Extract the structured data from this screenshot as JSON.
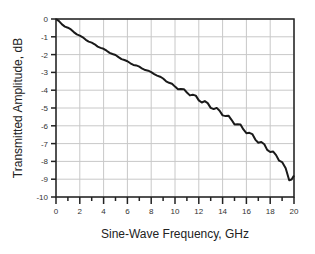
{
  "chart_data": {
    "type": "line",
    "title": "",
    "xlabel": "Sine-Wave Frequency, GHz",
    "ylabel": "Transmitted Amplitude, dB",
    "xlim": [
      0,
      20
    ],
    "ylim": [
      -10,
      0
    ],
    "x_ticks": [
      "0",
      "2",
      "4",
      "6",
      "8",
      "10",
      "12",
      "14",
      "16",
      "18",
      "20"
    ],
    "y_ticks": [
      "0",
      "-1",
      "-2",
      "-3",
      "-4",
      "-5",
      "-6",
      "-7",
      "-8",
      "-9",
      "-10"
    ],
    "grid": true,
    "legend": null,
    "series": [
      {
        "name": "Transmitted Amplitude",
        "x": [
          0,
          0.5,
          1,
          2,
          3,
          4,
          5,
          6,
          7,
          8,
          9,
          10,
          11,
          12,
          13,
          14,
          15,
          16,
          17,
          18,
          19,
          19.6,
          20
        ],
        "values": [
          0,
          -0.3,
          -0.5,
          -0.95,
          -1.35,
          -1.7,
          -2.05,
          -2.4,
          -2.7,
          -3.0,
          -3.35,
          -3.8,
          -4.1,
          -4.5,
          -4.9,
          -5.3,
          -5.8,
          -6.3,
          -6.85,
          -7.4,
          -8.0,
          -9.0,
          -8.8
        ]
      }
    ]
  }
}
